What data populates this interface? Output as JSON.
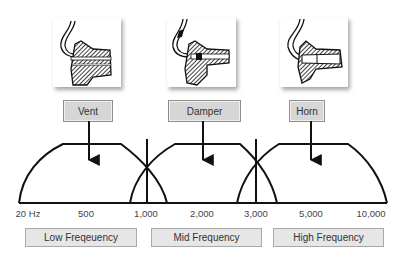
{
  "components": [
    {
      "label": "Vent",
      "image": "vent-earmold-cross-section"
    },
    {
      "label": "Damper",
      "image": "damper-earmold-cross-section"
    },
    {
      "label": "Horn",
      "image": "horn-earmold-cross-section"
    }
  ],
  "axis": {
    "ticks": [
      "20 Hz",
      "500",
      "1,000",
      "2,000",
      "3,000",
      "5,000",
      "10,000"
    ]
  },
  "bands": [
    {
      "label": "Low Freqeuency"
    },
    {
      "label": "Mid Frequency"
    },
    {
      "label": "High Frequency"
    }
  ],
  "colors": {
    "stroke": "#111111",
    "label_fill": "#d6d6d6",
    "band_fill": "#e6e6e6"
  }
}
